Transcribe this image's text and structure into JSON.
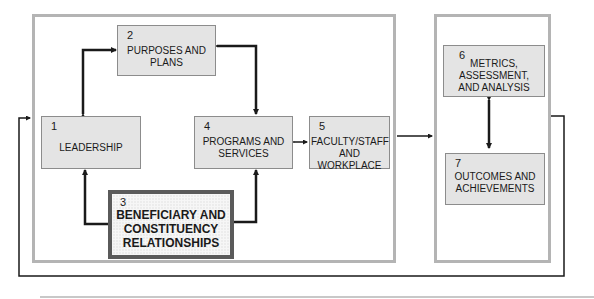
{
  "diagram": {
    "type": "flow",
    "groups": [
      {
        "id": "process",
        "label": ""
      },
      {
        "id": "results",
        "label": ""
      }
    ],
    "boxes": [
      {
        "id": "1",
        "number": "1",
        "label_lines": [
          "LEADERSHIP"
        ]
      },
      {
        "id": "2",
        "number": "2",
        "label_lines": [
          "PURPOSES AND",
          "PLANS"
        ]
      },
      {
        "id": "3",
        "number": "3",
        "label_lines": [
          "BENEFICIARY AND",
          "CONSTITUENCY",
          "RELATIONSHIPS"
        ]
      },
      {
        "id": "4",
        "number": "4",
        "label_lines": [
          "PROGRAMS AND",
          "SERVICES"
        ]
      },
      {
        "id": "5",
        "number": "5",
        "label_lines": [
          "FACULTY/STAFF",
          "AND WORKPLACE"
        ]
      },
      {
        "id": "6",
        "number": "6",
        "label_lines": [
          "METRICS,",
          "ASSESSMENT,",
          "AND ANALYSIS"
        ]
      },
      {
        "id": "7",
        "number": "7",
        "label_lines": [
          "OUTCOMES AND",
          "ACHIEVEMENTS"
        ]
      }
    ],
    "edges": [
      {
        "from": "1",
        "to": "2",
        "bidirectional": true
      },
      {
        "from": "2",
        "to": "4",
        "bidirectional": true
      },
      {
        "from": "3",
        "to": "1",
        "bidirectional": false
      },
      {
        "from": "3",
        "to": "4",
        "bidirectional": false
      },
      {
        "from": "4",
        "to": "5",
        "bidirectional": true
      },
      {
        "from": "6",
        "to": "7",
        "bidirectional": true
      },
      {
        "from": "process",
        "to": "results",
        "bidirectional": false
      },
      {
        "from": "results",
        "to": "process",
        "bidirectional": false,
        "note": "feedback loop"
      }
    ],
    "colors": {
      "box_fill": "#e4e4e4",
      "frame": "#b4b4b4",
      "arrow": "#1a1a1a",
      "highlight_border": "#5a5a5a"
    }
  }
}
